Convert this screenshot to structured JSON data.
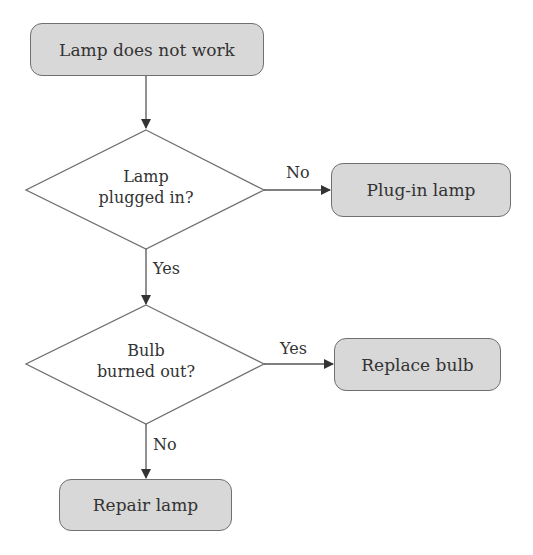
{
  "diagram": {
    "type": "flowchart",
    "nodes": {
      "start": {
        "label": "Lamp does not work",
        "shape": "rounded-rect"
      },
      "decision1": {
        "line1": "Lamp",
        "line2": "plugged in?",
        "shape": "diamond"
      },
      "plugin": {
        "label": "Plug-in lamp",
        "shape": "rounded-rect"
      },
      "decision2": {
        "line1": "Bulb",
        "line2": "burned out?",
        "shape": "diamond"
      },
      "replace": {
        "label": "Replace bulb",
        "shape": "rounded-rect"
      },
      "repair": {
        "label": "Repair lamp",
        "shape": "rounded-rect"
      }
    },
    "edges": {
      "d1_no": "No",
      "d1_yes": "Yes",
      "d2_yes": "Yes",
      "d2_no": "No"
    },
    "colors": {
      "box_fill": "#d8d8d8",
      "box_border": "#707070",
      "line": "#555555",
      "text": "#333333"
    }
  }
}
